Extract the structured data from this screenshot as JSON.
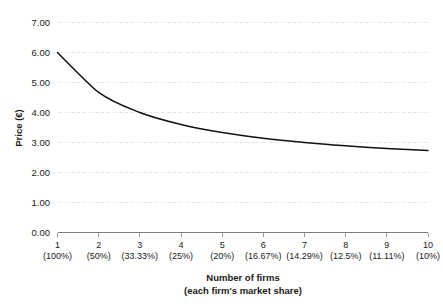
{
  "chart_data": {
    "type": "line",
    "title": "",
    "subtitle": "",
    "xlabel": "Number of firms",
    "xlabel_line2": "(each firm's market share)",
    "ylabel": "Price (€)",
    "grid": true,
    "legend": false,
    "legend_position": "none",
    "xlim": [
      1,
      10
    ],
    "ylim": [
      0.0,
      7.0
    ],
    "ytick_labels": [
      "7.00",
      "6.00",
      "5.00",
      "4.00",
      "3.00",
      "2.00",
      "1.00",
      "0.00"
    ],
    "ytick_values": [
      7.0,
      6.0,
      5.0,
      4.0,
      3.0,
      2.0,
      1.0,
      0.0
    ],
    "categories": [
      "1",
      "2",
      "3",
      "4",
      "5",
      "6",
      "7",
      "8",
      "9",
      "10"
    ],
    "category_sublabels": [
      "(100%)",
      "(50%)",
      "(33.33%)",
      "(25%)",
      "(20%)",
      "(16.67%)",
      "(14.29%)",
      "(12.5%)",
      "(11.11%)",
      "(10%)"
    ],
    "x": [
      1,
      2,
      3,
      4,
      5,
      6,
      7,
      8,
      9,
      10
    ],
    "values": [
      6.0,
      4.67,
      4.0,
      3.6,
      3.33,
      3.14,
      3.0,
      2.89,
      2.8,
      2.73
    ],
    "series": [
      {
        "name": "Price",
        "color": "#111111",
        "values": [
          6.0,
          4.67,
          4.0,
          3.6,
          3.33,
          3.14,
          3.0,
          2.89,
          2.8,
          2.73
        ]
      }
    ],
    "colors": {
      "line": "#111111",
      "grid": "#d9d9d9",
      "axis": "#7a7a7a",
      "text": "#1a1a1a",
      "background": "#ffffff"
    }
  }
}
